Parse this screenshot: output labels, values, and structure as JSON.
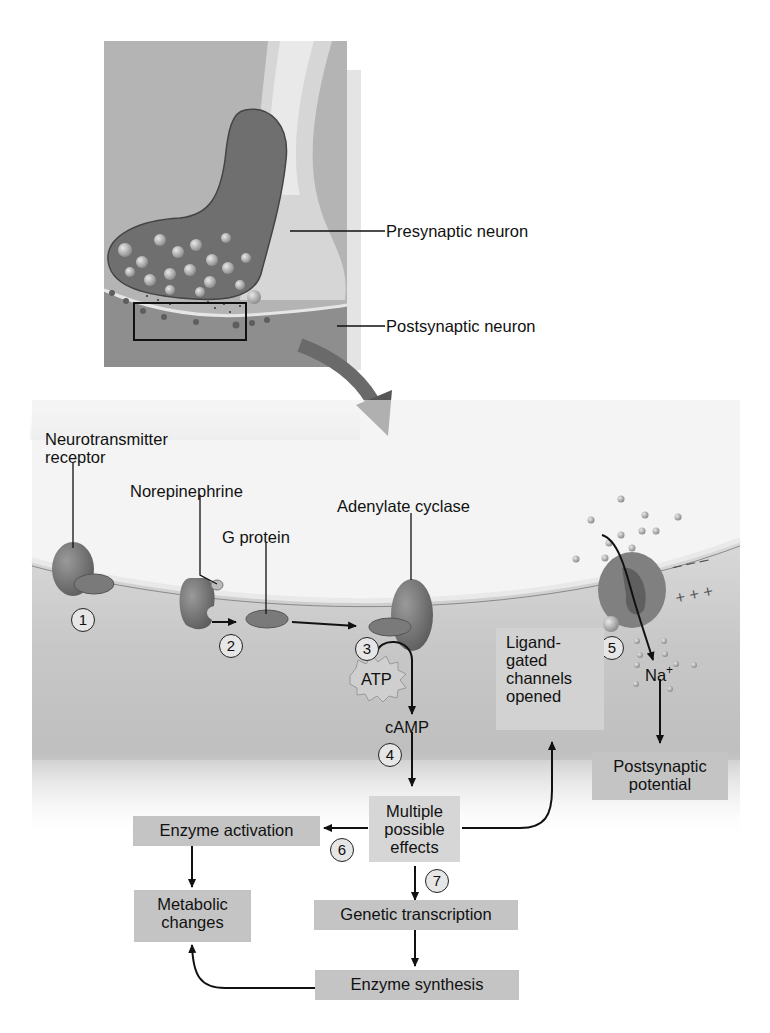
{
  "inset": {
    "labels": {
      "presynaptic": "Presynaptic neuron",
      "postsynaptic": "Postsynaptic neuron"
    }
  },
  "membrane": {
    "labels": {
      "receptor_line1": "Neurotransmitter",
      "receptor_line2": "receptor",
      "norepinephrine": "Norepinephrine",
      "g_protein": "G protein",
      "adenylate_cyclase": "Adenylate cyclase",
      "atp": "ATP",
      "camp": "cAMP",
      "na": "Na",
      "na_sup": "+",
      "neg_charges": "– – –",
      "pos_charges": "+ + +"
    },
    "steps": [
      "1",
      "2",
      "3",
      "4",
      "5",
      "6",
      "7"
    ]
  },
  "flow": {
    "ligand_line1": "Ligand-",
    "ligand_line2": "gated",
    "ligand_line3": "channels",
    "ligand_line4": "opened",
    "postsynaptic_line1": "Postsynaptic",
    "postsynaptic_line2": "potential",
    "multiple_line1": "Multiple",
    "multiple_line2": "possible",
    "multiple_line3": "effects",
    "enzyme_activation": "Enzyme activation",
    "metabolic_line1": "Metabolic",
    "metabolic_line2": "changes",
    "genetic_transcription": "Genetic transcription",
    "enzyme_synthesis": "Enzyme synthesis"
  }
}
